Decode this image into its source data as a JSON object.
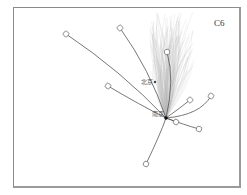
{
  "figure": {
    "panel_label": "C6",
    "hub": {
      "name": "南京",
      "x": 166,
      "y": 118
    },
    "point": {
      "name": "北京",
      "x": 155,
      "y": 82
    },
    "colors": {
      "frame": "#8a8a8a",
      "flow_line": "#555555",
      "background_cloud": "#b8b8b8",
      "hub_dot": "#111111"
    },
    "flows": [
      {
        "end": [
          66,
          34
        ],
        "ctrl": [
          120,
          70
        ]
      },
      {
        "end": [
          120,
          28
        ],
        "ctrl": [
          150,
          70
        ]
      },
      {
        "end": [
          167,
          52
        ],
        "ctrl": [
          175,
          80
        ]
      },
      {
        "end": [
          108,
          86
        ],
        "ctrl": [
          140,
          105
        ]
      },
      {
        "end": [
          211,
          96
        ],
        "ctrl": [
          200,
          115
        ]
      },
      {
        "end": [
          190,
          100
        ],
        "ctrl": [
          180,
          108
        ]
      },
      {
        "end": [
          199,
          129
        ],
        "ctrl": [
          185,
          125
        ]
      },
      {
        "end": [
          176,
          122
        ],
        "ctrl": [
          172,
          120
        ]
      },
      {
        "end": [
          146,
          164
        ],
        "ctrl": [
          160,
          135
        ]
      }
    ]
  }
}
